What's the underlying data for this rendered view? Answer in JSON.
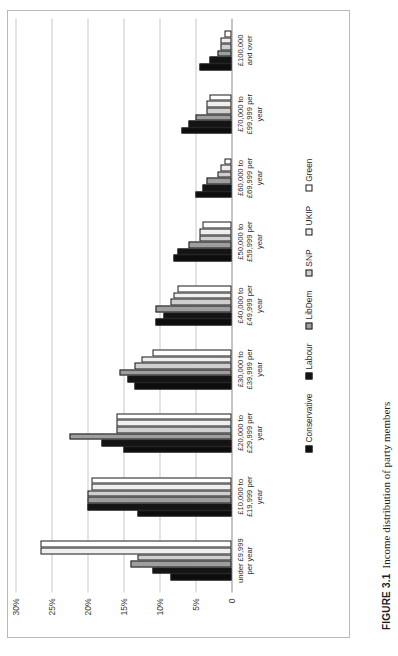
{
  "figure": {
    "caption_label": "FIGURE 3.1",
    "caption_text": "Income distribution of party members"
  },
  "chart_data": {
    "type": "bar",
    "orientation": "rotated-90",
    "title": "",
    "xlabel": "",
    "ylabel": "",
    "ylim": [
      0,
      30
    ],
    "ytick_labels": [
      "30%",
      "25%",
      "20%",
      "15%",
      "10%",
      "5%",
      "0"
    ],
    "ytick_values": [
      30,
      25,
      20,
      15,
      10,
      5,
      0
    ],
    "grid": true,
    "legend_position": "bottom",
    "categories": [
      "under £9,999\nper year",
      "£10,000 to\n£19,999 per\nyear",
      "£20,000 to\n£29,999 per\nyear",
      "£30,000 to\n£39,999 per\nyear",
      "£40,000 to\n£49,999 per\nyear",
      "£50,000 to\n£59,999 per\nyear",
      "£60,000 to\n£69,999 per\nyear",
      "£70,000 to\n£99,999 per\nyear",
      "£100,000\nand over"
    ],
    "series": [
      {
        "name": "Conservative",
        "color": "#0d0d0d",
        "values": [
          8.5,
          13.0,
          15.0,
          13.5,
          10.5,
          8.0,
          5.0,
          7.0,
          4.5
        ]
      },
      {
        "name": "Labour",
        "color": "#141414",
        "values": [
          11.0,
          20.0,
          18.0,
          14.5,
          9.5,
          7.5,
          4.0,
          6.0,
          3.0
        ]
      },
      {
        "name": "LibDem",
        "color": "#9e9e9e",
        "values": [
          14.0,
          20.0,
          22.5,
          15.5,
          10.5,
          6.0,
          3.5,
          5.0,
          2.0
        ]
      },
      {
        "name": "SNP",
        "color": "#cfcfcf",
        "values": [
          13.0,
          20.0,
          16.0,
          13.5,
          8.5,
          4.5,
          2.0,
          3.5,
          1.5
        ]
      },
      {
        "name": "UKIP",
        "color": "#efefef",
        "values": [
          26.5,
          19.5,
          16.0,
          12.5,
          8.0,
          4.5,
          1.5,
          3.5,
          1.5
        ]
      },
      {
        "name": "Green",
        "color": "#ffffff",
        "values": [
          26.5,
          19.5,
          16.0,
          11.0,
          7.5,
          4.0,
          1.0,
          3.0,
          1.0
        ]
      }
    ]
  },
  "legend": {
    "items": [
      {
        "label": "Conservative",
        "swatch": "#0d0d0d"
      },
      {
        "label": "Labour",
        "swatch": "#141414"
      },
      {
        "label": "LibDem",
        "swatch": "#9e9e9e"
      },
      {
        "label": "SNP",
        "swatch": "#cfcfcf"
      },
      {
        "label": "UKIP",
        "swatch": "#efefef"
      },
      {
        "label": "Green",
        "swatch": "#ffffff"
      }
    ]
  }
}
